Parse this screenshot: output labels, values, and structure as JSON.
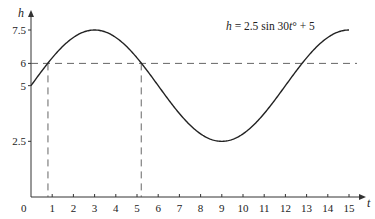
{
  "chart_data": {
    "type": "line",
    "title": "",
    "equation": {
      "h": "h",
      "rest": " = 2.5 sin 30",
      "t": "t",
      "deg": "°",
      "tail": " + 5"
    },
    "xlabel": "t",
    "ylabel": "h",
    "origin_label": "0",
    "xlim": [
      0,
      15
    ],
    "ylim": [
      0,
      7.5
    ],
    "x_ticks": [
      1,
      2,
      3,
      4,
      5,
      6,
      7,
      8,
      9,
      10,
      11,
      12,
      13,
      14,
      15
    ],
    "y_ticks": [
      2.5,
      5,
      6,
      7.5
    ],
    "grid": false,
    "series": [
      {
        "name": "h = 2.5 sin 30t° + 5",
        "function": "2.5*sin(30*t deg)+5",
        "x": [
          0,
          1,
          2,
          3,
          4,
          5,
          6,
          7,
          8,
          9,
          10,
          11,
          12,
          13,
          14,
          15
        ],
        "values": [
          5,
          6.25,
          7.17,
          7.5,
          7.17,
          6.25,
          5,
          3.75,
          2.83,
          2.5,
          2.83,
          3.75,
          5,
          6.25,
          7.17,
          7.5
        ],
        "color": "#222222"
      }
    ],
    "reference_lines": {
      "horizontal": {
        "y": 6,
        "style": "dashed"
      },
      "vertical": [
        {
          "x": 0.8,
          "style": "dashed"
        },
        {
          "x": 5.2,
          "style": "dashed"
        }
      ]
    }
  }
}
